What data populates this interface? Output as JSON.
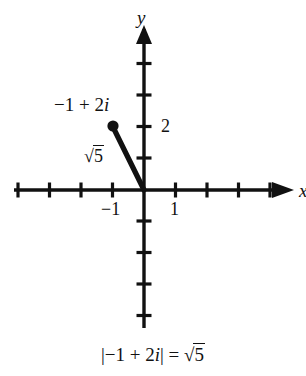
{
  "figure": {
    "type": "complex-plane-diagram",
    "background_color": "#ffffff",
    "ink_color": "#111111"
  },
  "axes": {
    "x_axis_name": "x",
    "y_axis_name": "y",
    "origin_px": [
      144,
      190
    ],
    "unit_px": 31.5,
    "x_ticks": [
      -4,
      -3,
      -2,
      -1,
      1,
      2,
      3,
      4
    ],
    "y_ticks": [
      -4,
      -3,
      -2,
      -1,
      1,
      2,
      3,
      4
    ],
    "x_tick_labels": [
      {
        "value": -1,
        "text": "−1"
      },
      {
        "value": 1,
        "text": "1"
      }
    ],
    "y_tick_labels": [
      {
        "value": 2,
        "text": "2"
      }
    ]
  },
  "point": {
    "label_text": "−1 + 2",
    "label_imag_unit": "i",
    "coords": [
      -1,
      2
    ],
    "marker": "filled-dot"
  },
  "segment": {
    "from": [
      0,
      0
    ],
    "to": [
      -1,
      2
    ],
    "length_radicand": "5",
    "length_prefix": "√"
  },
  "caption": {
    "abs_open": "|−1 + 2",
    "imag_unit": "i",
    "abs_close": "| = ",
    "radical_sign": "√",
    "radicand": "5"
  }
}
